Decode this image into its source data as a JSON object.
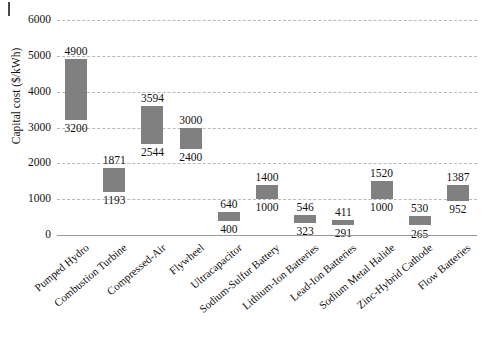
{
  "chart_data": {
    "type": "bar",
    "bar_style": "floating-range",
    "title": "",
    "xlabel": "",
    "ylabel": "Capital cost ($/kWh)",
    "ylim": [
      0,
      6000
    ],
    "ytick_labels": [
      "6000",
      "5000",
      "4000",
      "3000",
      "2000",
      "1000",
      "0"
    ],
    "ytick_values": [
      6000,
      5000,
      4000,
      3000,
      2000,
      1000,
      0
    ],
    "grid": true,
    "legend": "none",
    "bar_color": "#808080",
    "gridline_color": "#b9b9b9",
    "categories": [
      "Pumped Hydro",
      "Combustion Turbine",
      "Compressed-Air",
      "Flywheel",
      "Ultracapacitor",
      "Sodium-Sulfur Battery",
      "Lithium-Ion Batteries",
      "Lead-Ion Batteries",
      "Sodium Metal Halide",
      "Zinc-Hybrid Cathode",
      "Flow Batteries"
    ],
    "low": [
      3200,
      1193,
      2544,
      2400,
      400,
      1000,
      323,
      291,
      1000,
      265,
      952
    ],
    "high": [
      4900,
      1871,
      3594,
      3000,
      640,
      1400,
      546,
      411,
      1520,
      530,
      1387
    ],
    "points": [
      {
        "category": "Pumped Hydro",
        "low": 3200,
        "high": 4900,
        "low_label": "3200",
        "high_label": "4900"
      },
      {
        "category": "Combustion Turbine",
        "low": 1193,
        "high": 1871,
        "low_label": "1193",
        "high_label": "1871"
      },
      {
        "category": "Compressed-Air",
        "low": 2544,
        "high": 3594,
        "low_label": "2544",
        "high_label": "3594"
      },
      {
        "category": "Flywheel",
        "low": 2400,
        "high": 3000,
        "low_label": "2400",
        "high_label": "3000"
      },
      {
        "category": "Ultracapacitor",
        "low": 400,
        "high": 640,
        "low_label": "400",
        "high_label": "640"
      },
      {
        "category": "Sodium-Sulfur Battery",
        "low": 1000,
        "high": 1400,
        "low_label": "1000",
        "high_label": "1400"
      },
      {
        "category": "Lithium-Ion Batteries",
        "low": 323,
        "high": 546,
        "low_label": "323",
        "high_label": "546"
      },
      {
        "category": "Lead-Ion Batteries",
        "low": 291,
        "high": 411,
        "low_label": "291",
        "high_label": "411"
      },
      {
        "category": "Sodium Metal Halide",
        "low": 1000,
        "high": 1520,
        "low_label": "1000",
        "high_label": "1520"
      },
      {
        "category": "Zinc-Hybrid Cathode",
        "low": 265,
        "high": 530,
        "low_label": "265",
        "high_label": "530"
      },
      {
        "category": "Flow Batteries",
        "low": 952,
        "high": 1387,
        "low_label": "952",
        "high_label": "1387"
      }
    ]
  }
}
